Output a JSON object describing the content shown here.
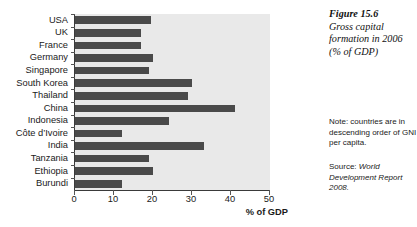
{
  "chart_data": {
    "type": "bar",
    "orientation": "horizontal",
    "title": "Gross capital formation in 2006 (% of GDP)",
    "figure_number": "Figure 15.6",
    "xlabel": "% of GDP",
    "ylabel": "",
    "xlim": [
      0,
      50
    ],
    "xticks": [
      0,
      10,
      20,
      30,
      40,
      50
    ],
    "xtick_labels": [
      "0",
      "10",
      "20",
      "30",
      "40",
      "50"
    ],
    "grid": false,
    "legend": "none",
    "bar_color": "#4a4a4a",
    "plot_background": "#e9e9e9",
    "categories": [
      "USA",
      "UK",
      "France",
      "Germany",
      "Singapore",
      "South Korea",
      "Thailand",
      "China",
      "Indonesia",
      "Côte d’Ivoire",
      "India",
      "Tanzania",
      "Ethiopia",
      "Burundi"
    ],
    "values": [
      19.5,
      17,
      17,
      20,
      19,
      30,
      29,
      41,
      24,
      12,
      33,
      19,
      20,
      12
    ],
    "annotations": [
      "Note: countries are in descending order of GNI per capita.",
      "Source: World Development Report 2008."
    ]
  },
  "caption": {
    "figure_number": "Figure 15.6",
    "text": "Gross capital formation in 2006 (% of GDP)"
  },
  "note": {
    "text": "Note: countries are in descending order of GNI per capita."
  },
  "source": {
    "prefix": "Source:",
    "publication": "World Development Report 2008."
  },
  "axis": {
    "x_title": "% of GDP"
  }
}
